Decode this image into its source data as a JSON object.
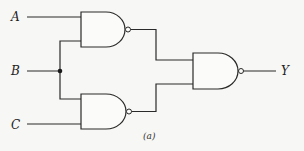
{
  "diagram": {
    "type": "logic-circuit",
    "inputs": [
      {
        "id": "A",
        "label": "A"
      },
      {
        "id": "B",
        "label": "B"
      },
      {
        "id": "C",
        "label": "C"
      }
    ],
    "outputs": [
      {
        "id": "Y",
        "label": "Y"
      }
    ],
    "gates": [
      {
        "id": "G1",
        "type": "NAND",
        "inputs": [
          "A",
          "B"
        ]
      },
      {
        "id": "G2",
        "type": "NAND",
        "inputs": [
          "B",
          "C"
        ]
      },
      {
        "id": "G3",
        "type": "NAND",
        "inputs": [
          "G1",
          "G2"
        ],
        "output": "Y"
      }
    ],
    "junctions": [
      {
        "net": "B"
      }
    ],
    "caption": "(a)"
  }
}
